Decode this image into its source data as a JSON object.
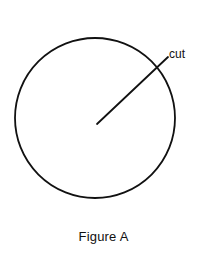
{
  "figure": {
    "caption": "Figure A",
    "background_color": "#ffffff",
    "stroke_color": "#111111",
    "text_color": "#111111"
  },
  "annotations": {
    "cut_label": "cut"
  },
  "chart_data": {
    "type": "diagram",
    "title": "Figure A",
    "shapes": [
      {
        "name": "circle",
        "kind": "circle",
        "center_x": 95,
        "center_y": 118,
        "radius": 80,
        "stroke": "#111111",
        "stroke_width": 1.8,
        "fill": "none"
      },
      {
        "name": "cut-radius-line",
        "kind": "line",
        "x1": 97,
        "y1": 124,
        "x2": 168,
        "y2": 57,
        "stroke": "#111111",
        "stroke_width": 1.8,
        "label": "cut"
      }
    ],
    "labels": [
      {
        "text": "cut",
        "x": 169,
        "y": 54,
        "anchor": "start",
        "font_size": 12
      },
      {
        "text": "Figure A",
        "x": 104,
        "y": 241,
        "anchor": "middle",
        "font_size": 13
      }
    ],
    "xlim": [
      0,
      207
    ],
    "ylim": [
      0,
      268
    ],
    "grid": false,
    "legend": null
  }
}
